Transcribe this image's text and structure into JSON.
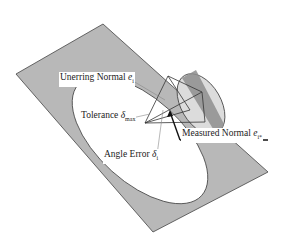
{
  "diagram": {
    "labels": {
      "unerring_normal": {
        "text": "Unerring Normal ",
        "symbol": "e",
        "subscript": "i"
      },
      "tolerance": {
        "text": "Tolerance ",
        "symbol": "δ",
        "subscript": "max"
      },
      "measured_normal": {
        "text": "Measured Normal ",
        "symbol": "e",
        "subscript": "i*"
      },
      "angle_error": {
        "text": "Angle Error ",
        "symbol": "δ",
        "subscript": "i"
      }
    },
    "colors": {
      "plane": "#b8b8b8",
      "ellipse": "#ffffff",
      "cone_base": "#d8d8d8",
      "cone_dark": "#8a8a8a",
      "outline": "#333333"
    }
  }
}
